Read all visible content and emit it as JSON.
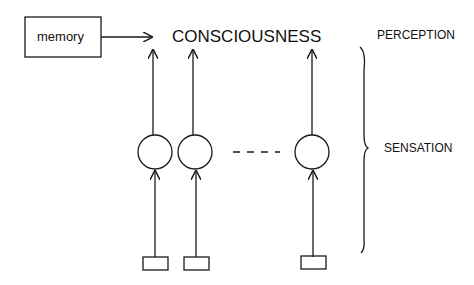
{
  "diagram": {
    "memory_label": "memory",
    "consciousness_label": "CONSCIOUSNESS",
    "perception_label": "PERCEPTION",
    "sensation_label": "SENSATION",
    "ellipsis": "- - -",
    "stroke_color": "#1a1a1a"
  }
}
